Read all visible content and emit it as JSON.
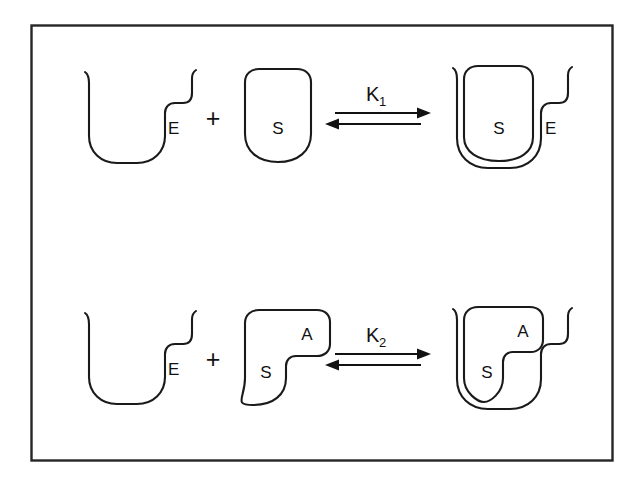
{
  "figure": {
    "background_color": "#ffffff",
    "stroke_color": "#1a1a1a",
    "frame_color": "#262626"
  },
  "reactions": [
    {
      "id": "reaction-1",
      "equilibrium_constant": "K",
      "equilibrium_subscript": "1",
      "plus_sign": "+",
      "reactants": [
        {
          "id": "enzyme",
          "label": "E",
          "shape": "stepped-cup"
        },
        {
          "id": "substrate",
          "label": "S",
          "shape": "rounded-bottom-block"
        }
      ],
      "product": {
        "id": "enzyme-substrate-complex",
        "enzyme_label": "E",
        "substrate_label": "S",
        "shape": "substrate-nested-in-cup"
      }
    },
    {
      "id": "reaction-2",
      "equilibrium_constant": "K",
      "equilibrium_subscript": "2",
      "plus_sign": "+",
      "reactants": [
        {
          "id": "enzyme",
          "label": "E",
          "shape": "stepped-cup"
        },
        {
          "id": "substrate-analog",
          "label": "S",
          "tab_label": "A",
          "shape": "notched-block-with-tab"
        }
      ],
      "product": {
        "id": "enzyme-substrate-analog-complex",
        "substrate_label": "S",
        "tab_label": "A",
        "shape": "notched-substrate-nested-in-cup"
      }
    }
  ]
}
